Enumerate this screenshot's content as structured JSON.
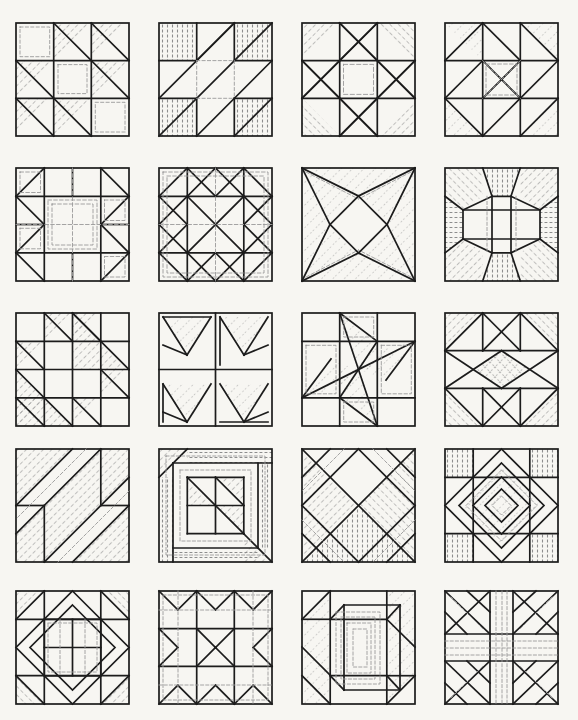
{
  "page": {
    "title": "Quilt Block Pattern Plate",
    "kind": "line-drawing-plate",
    "background_color": "#f7f6f2",
    "ink_color": "#1a1a1a",
    "hatch_color": "#6d6d6d",
    "dashed_color": "#8a8a8a",
    "columns": 4,
    "rows": 5,
    "block_count": 20,
    "block_size_px": 113,
    "col_x": [
      16,
      159,
      302,
      445
    ],
    "row_y": [
      23,
      168,
      313,
      449,
      591
    ]
  },
  "blocks": [
    {
      "index": 1,
      "row": 1,
      "col": 1,
      "name": "shoofly-half-square-triangles",
      "label": "Shoo Fly / Half-Square Triangle Nine Patch",
      "grid": "3x3",
      "shaded_units": 5,
      "description": "Nine patch with diagonal half-square triangles shaded in five cells"
    },
    {
      "index": 2,
      "row": 1,
      "col": 2,
      "name": "jacobs-ladder-diagonal-bars",
      "label": "Jacob's Ladder Diagonal Bars",
      "grid": "3x3",
      "shaded_units": 4,
      "description": "Wide diagonal bands running corner to corner with four hatched corner squares"
    },
    {
      "index": 3,
      "row": 1,
      "col": 3,
      "name": "ohio-star-eight-point",
      "label": "Ohio Star / Eight Pointed Star",
      "grid": "3x3",
      "shaded_units": 4,
      "description": "Central square with quarter-square triangle points and shaded corners"
    },
    {
      "index": 4,
      "row": 1,
      "col": 4,
      "name": "card-trick-star",
      "label": "Card Trick Star",
      "grid": "3x3",
      "shaded_units": 8,
      "description": "Interlocking triangles forming a pinwheel star around a center square"
    },
    {
      "index": 5,
      "row": 2,
      "col": 1,
      "name": "churn-dash-frame",
      "label": "Churn Dash with Framed Center",
      "grid": "4x4",
      "shaded_units": 4,
      "description": "Corner triangles with bar units framing a large open center"
    },
    {
      "index": 6,
      "row": 2,
      "col": 2,
      "name": "double-x-sawtooth-star",
      "label": "Double X Sawtooth Star",
      "grid": "4x4",
      "shaded_units": 8,
      "description": "Sawtooth chevrons pointing inward to a crossed center"
    },
    {
      "index": 7,
      "row": 2,
      "col": 3,
      "name": "four-point-kite-star",
      "label": "Four Point Kite Star",
      "grid": "1x1",
      "shaded_units": 4,
      "description": "Four concave kite shapes meeting at a small center diamond"
    },
    {
      "index": 8,
      "row": 2,
      "col": 4,
      "name": "octagon-medallion",
      "label": "Octagon Medallion",
      "grid": "3x3",
      "shaded_units": 8,
      "description": "Central octagon surrounded by shaded corner and side wedges"
    },
    {
      "index": 9,
      "row": 3,
      "col": 1,
      "name": "broken-dishes-stepped",
      "label": "Broken Dishes Stepped",
      "grid": "4x4",
      "shaded_units": 6,
      "description": "Stepped diagonal of half-square triangles of two scales"
    },
    {
      "index": 10,
      "row": 3,
      "col": 2,
      "name": "flying-geese-pinwheel",
      "label": "Flying Geese Pinwheel",
      "grid": "2x2",
      "shaded_units": 4,
      "description": "Four flying geese triangle units rotating around the center"
    },
    {
      "index": 11,
      "row": 3,
      "col": 3,
      "name": "friendship-pinwheel",
      "label": "Friendship Pinwheel",
      "grid": "3x3",
      "shaded_units": 4,
      "description": "Four elongated parallelogram blades spinning about the center"
    },
    {
      "index": 12,
      "row": 3,
      "col": 4,
      "name": "crossed-star-crosshatch",
      "label": "Crossed Star with Crosshatch Center",
      "grid": "3x3",
      "shaded_units": 4,
      "description": "Large X of triangles with cross-hatched square on point at center"
    },
    {
      "index": 13,
      "row": 4,
      "col": 1,
      "name": "roman-stripe-diagonal",
      "label": "Roman Stripe Diagonal",
      "grid": "4x4",
      "shaded_units": 3,
      "description": "Heavy diagonal bands with two plain corner squares"
    },
    {
      "index": 14,
      "row": 4,
      "col": 2,
      "name": "log-cabin-courthouse-steps",
      "label": "Log Cabin / Courthouse Steps",
      "grid": "nested",
      "shaded_units": 6,
      "description": "Nested rectangular logs around an off-centre small square"
    },
    {
      "index": 15,
      "row": 4,
      "col": 3,
      "name": "kings-x-diagonal-lattice",
      "label": "King's X Diagonal Lattice",
      "grid": "diagonal",
      "shaded_units": 6,
      "description": "On-point lattice of crossing diagonal bands edge to edge"
    },
    {
      "index": 16,
      "row": 4,
      "col": 4,
      "name": "concentric-diamond-in-square",
      "label": "Concentric Diamond in a Square",
      "grid": "3x3",
      "shaded_units": 5,
      "description": "Square on point with concentric diamonds and hatched corners"
    },
    {
      "index": 17,
      "row": 5,
      "col": 1,
      "name": "diamond-ring-framed",
      "label": "Diamond Ring Framed",
      "grid": "3x3",
      "shaded_units": 4,
      "description": "Diamond ring band around a centre square with corner triangles"
    },
    {
      "index": 18,
      "row": 5,
      "col": 2,
      "name": "bow-tie-spool-grid",
      "label": "Bow Tie / Spool Grid",
      "grid": "3x3",
      "shaded_units": 8,
      "description": "Spool shapes notched on each side of a nine patch"
    },
    {
      "index": 19,
      "row": 5,
      "col": 3,
      "name": "attic-window-perspective",
      "label": "Attic Window Perspective Box",
      "grid": "perspective",
      "shaded_units": 4,
      "description": "Three-dimensional box drawn in perspective with nested frames"
    },
    {
      "index": 20,
      "row": 5,
      "col": 4,
      "name": "crossroads-sawtooth",
      "label": "Crossroads with Sawtooth Corners",
      "grid": "3x3",
      "shaded_units": 8,
      "description": "Wide cross bars with sawtooth triangle squares in the corners"
    }
  ]
}
